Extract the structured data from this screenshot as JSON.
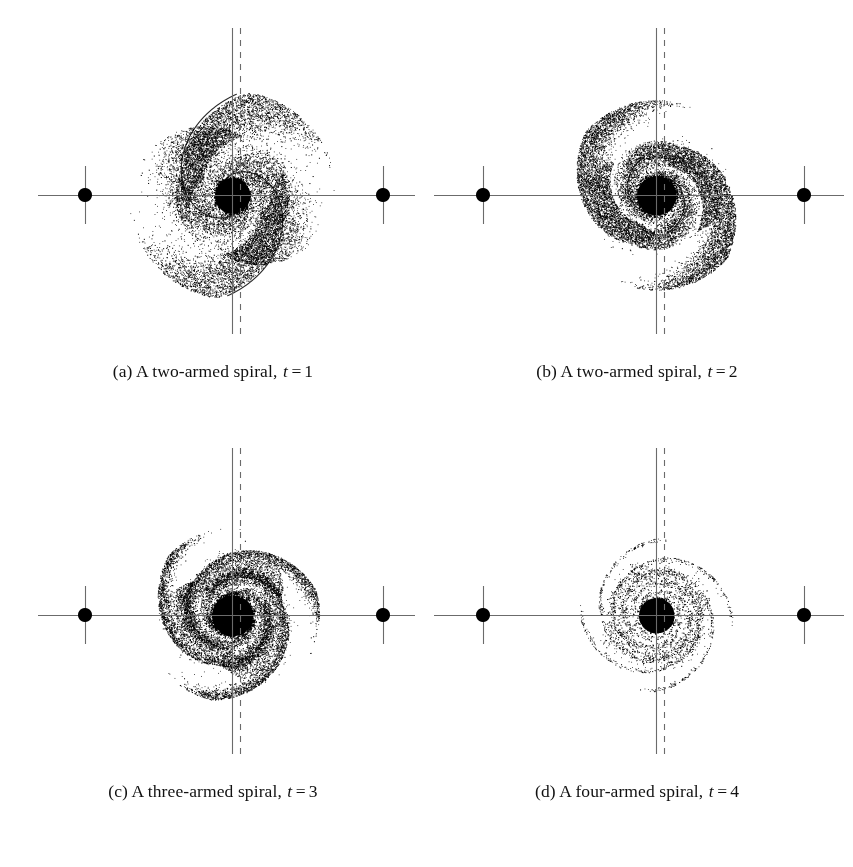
{
  "figure": {
    "type": "multi-panel-scatter-figure",
    "background": "#ffffff",
    "ink_color": "#000000",
    "axis_color": "#6b6b6b",
    "width": 853,
    "height": 867,
    "rows": 2,
    "columns": 2
  },
  "chart_data": {
    "type": "scatter",
    "title": "",
    "xlabel": "",
    "ylabel": "",
    "grid": false,
    "legend": null,
    "panels": [
      {
        "id": "a",
        "label": "(a)",
        "caption_text": "A two-armed spiral,",
        "caption_var": "t",
        "caption_eq": "=",
        "caption_value": "1",
        "caption_full": "(a) A two-armed spiral, t = 1",
        "arms": 2,
        "t": 1,
        "n_points": 14000,
        "core_radius": 17,
        "disk_radius": 104,
        "winding": 2.0,
        "arm_contrast": 0.55,
        "spread": 0.46,
        "density": 1.0,
        "cut_angle": 1.62,
        "outer_taper": 1.0,
        "center_x": 232,
        "center_y": 173,
        "axis_y": 173,
        "axis_x_start": 38,
        "axis_x_end": 415,
        "marker_left_x": 85,
        "marker_right_x": 383,
        "marker_radius": 7,
        "tick_half_height": 29,
        "vline_solid_x": 232,
        "vline_dashed_x": 240,
        "vline_top": 6,
        "vline_bottom": 312
      },
      {
        "id": "b",
        "label": "(b)",
        "caption_text": "A two-armed spiral,",
        "caption_var": "t",
        "caption_eq": "=",
        "caption_value": "2",
        "caption_full": "(b) A two-armed spiral, t = 2",
        "arms": 2,
        "t": 2,
        "n_points": 14500,
        "core_radius": 19,
        "disk_radius": 99,
        "winding": 3.3,
        "arm_contrast": 0.72,
        "spread": 0.4,
        "density": 1.05,
        "cut_angle": 1.3,
        "outer_taper": 0.96,
        "center_x": 232,
        "center_y": 173,
        "axis_y": 173,
        "axis_x_start": 10,
        "axis_x_end": 420,
        "marker_left_x": 59,
        "marker_right_x": 380,
        "marker_radius": 7,
        "tick_half_height": 29,
        "vline_solid_x": 232,
        "vline_dashed_x": 240,
        "vline_top": 6,
        "vline_bottom": 312
      },
      {
        "id": "c",
        "label": "(c)",
        "caption_text": "A three-armed spiral,",
        "caption_var": "t",
        "caption_eq": "=",
        "caption_value": "3",
        "caption_full": "(c) A three-armed spiral, t = 3",
        "arms": 3,
        "t": 3,
        "n_points": 13500,
        "core_radius": 20,
        "disk_radius": 95,
        "winding": 3.9,
        "arm_contrast": 0.82,
        "spread": 0.34,
        "density": 1.0,
        "cut_angle": 1.05,
        "outer_taper": 0.92,
        "center_x": 232,
        "center_y": 173,
        "axis_y": 173,
        "axis_x_start": 38,
        "axis_x_end": 415,
        "marker_left_x": 85,
        "marker_right_x": 383,
        "marker_radius": 7,
        "tick_half_height": 29,
        "vline_solid_x": 232,
        "vline_dashed_x": 240,
        "vline_top": 6,
        "vline_bottom": 312
      },
      {
        "id": "d",
        "label": "(d)",
        "caption_text": "A four-armed spiral,",
        "caption_var": "t",
        "caption_eq": "=",
        "caption_value": "4",
        "caption_full": "(d) A four-armed spiral, t = 4",
        "arms": 4,
        "t": 4,
        "n_points": 7200,
        "core_radius": 17,
        "disk_radius": 90,
        "winding": 5.2,
        "arm_contrast": 0.94,
        "spread": 0.17,
        "density": 0.45,
        "cut_angle": 0.85,
        "outer_taper": 0.85,
        "center_x": 232,
        "center_y": 173,
        "axis_y": 173,
        "axis_x_start": 10,
        "axis_x_end": 420,
        "marker_left_x": 59,
        "marker_right_x": 380,
        "marker_radius": 7,
        "tick_half_height": 29,
        "vline_solid_x": 232,
        "vline_dashed_x": 240,
        "vline_top": 6,
        "vline_bottom": 312
      }
    ]
  }
}
